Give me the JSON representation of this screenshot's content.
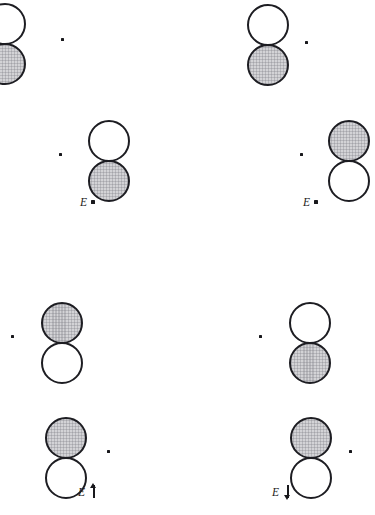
{
  "figure": {
    "background_color": "#ffffff",
    "outline_color": "#1d1d22",
    "shaded_fill_color": "#d3d3d6",
    "unshaded_fill_color": "#ffffff",
    "dot_color": "#18181c",
    "sphere_diameter_px": 42,
    "panel_count": 6
  },
  "panels": [
    {
      "id": "panel-top-left",
      "row": 1,
      "column": 1,
      "top_sphere_shading": "unshaded",
      "bottom_sphere_shading": "shaded",
      "charge_dot_side": "right",
      "field_label": null,
      "field_marker": null,
      "clipped_at_left_edge": true
    },
    {
      "id": "panel-top-right",
      "row": 1,
      "column": 2,
      "top_sphere_shading": "unshaded",
      "bottom_sphere_shading": "shaded",
      "charge_dot_side": "right",
      "field_label": null,
      "field_marker": null,
      "clipped_at_left_edge": false
    },
    {
      "id": "panel-middle-left",
      "row": 2,
      "column": 1,
      "top_sphere_shading": "unshaded",
      "bottom_sphere_shading": "shaded",
      "charge_dot_side": "left",
      "field_label": "E",
      "field_marker": "dot",
      "clipped_at_left_edge": false
    },
    {
      "id": "panel-middle-right",
      "row": 2,
      "column": 2,
      "top_sphere_shading": "shaded",
      "bottom_sphere_shading": "unshaded",
      "charge_dot_side": "left",
      "field_label": "E",
      "field_marker": "dot",
      "clipped_at_left_edge": false
    },
    {
      "id": "panel-lower-left",
      "row": 3,
      "column": 1,
      "top_sphere_shading": "shaded",
      "bottom_sphere_shading": "unshaded",
      "charge_dot_side": "left",
      "field_label": null,
      "field_marker": null,
      "clipped_at_left_edge": false
    },
    {
      "id": "panel-lower-right",
      "row": 3,
      "column": 2,
      "top_sphere_shading": "unshaded",
      "bottom_sphere_shading": "shaded",
      "charge_dot_side": "left",
      "field_label": null,
      "field_marker": null,
      "clipped_at_left_edge": false
    },
    {
      "id": "panel-bottom-left",
      "row": 4,
      "column": 1,
      "top_sphere_shading": "shaded",
      "bottom_sphere_shading": "unshaded",
      "charge_dot_side": "right",
      "field_label": "E",
      "field_marker": "arrow-up",
      "clipped_at_left_edge": false
    },
    {
      "id": "panel-bottom-right",
      "row": 4,
      "column": 2,
      "top_sphere_shading": "shaded",
      "bottom_sphere_shading": "unshaded",
      "charge_dot_side": "right",
      "field_label": "E",
      "field_marker": "arrow-down",
      "clipped_at_left_edge": false
    }
  ]
}
